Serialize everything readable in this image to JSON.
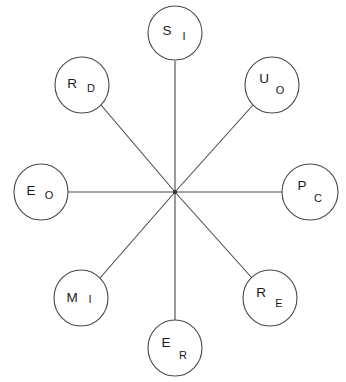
{
  "diagram": {
    "type": "radial-star-network",
    "canvas": {
      "width": 346,
      "height": 382,
      "background": "#ffffff"
    },
    "stroke_color": "#4a4a4a",
    "text_color": "#1a1a1a",
    "hub": {
      "label": "center-hub",
      "x": 175,
      "y": 192
    },
    "nodes": [
      {
        "id": "node-top",
        "main": "S",
        "sub": "I",
        "cx": 175,
        "cy": 33,
        "rx": 27,
        "ry": 27,
        "main_dx": -8,
        "main_dy": 2,
        "sub_dx": 9,
        "sub_dy": 7
      },
      {
        "id": "node-top-right",
        "main": "U",
        "sub": "O",
        "cx": 272,
        "cy": 85,
        "rx": 27,
        "ry": 28,
        "main_dx": -8,
        "main_dy": -2,
        "sub_dx": 8,
        "sub_dy": 9
      },
      {
        "id": "node-right",
        "main": "P",
        "sub": "C",
        "cx": 310,
        "cy": 192,
        "rx": 28,
        "ry": 28,
        "main_dx": -8,
        "main_dy": -2,
        "sub_dx": 8,
        "sub_dy": 10
      },
      {
        "id": "node-bottom-right",
        "main": "R",
        "sub": "E",
        "cx": 270,
        "cy": 298,
        "rx": 27,
        "ry": 28,
        "main_dx": -9,
        "main_dy": -1,
        "sub_dx": 9,
        "sub_dy": 9
      },
      {
        "id": "node-bottom",
        "main": "E",
        "sub": "R",
        "cx": 175,
        "cy": 348,
        "rx": 27,
        "ry": 28,
        "main_dx": -9,
        "main_dy": -1,
        "sub_dx": 8,
        "sub_dy": 11
      },
      {
        "id": "node-bottom-left",
        "main": "M",
        "sub": "I",
        "cx": 81,
        "cy": 298,
        "rx": 27,
        "ry": 28,
        "main_dx": -9,
        "main_dy": 4,
        "sub_dx": 9,
        "sub_dy": 5
      },
      {
        "id": "node-left",
        "main": "E",
        "sub": "O",
        "cx": 41,
        "cy": 192,
        "rx": 27,
        "ry": 28,
        "main_dx": -10,
        "main_dy": 3,
        "sub_dx": 8,
        "sub_dy": 7
      },
      {
        "id": "node-top-left",
        "main": "R",
        "sub": "D",
        "cx": 82,
        "cy": 85,
        "rx": 27,
        "ry": 28,
        "main_dx": -10,
        "main_dy": 3,
        "sub_dx": 9,
        "sub_dy": 7
      }
    ],
    "edges": [
      {
        "id": "edge-hub-top",
        "from": "center-hub",
        "to": "node-top",
        "x1": 175,
        "y1": 192,
        "x2": 175,
        "y2": 61
      },
      {
        "id": "edge-hub-top-right",
        "from": "center-hub",
        "to": "node-top-right",
        "x1": 175,
        "y1": 192,
        "x2": 253,
        "y2": 105
      },
      {
        "id": "edge-hub-right",
        "from": "center-hub",
        "to": "node-right",
        "x1": 175,
        "y1": 192,
        "x2": 282,
        "y2": 192
      },
      {
        "id": "edge-hub-bottom-right",
        "from": "center-hub",
        "to": "node-bottom-right",
        "x1": 175,
        "y1": 192,
        "x2": 252,
        "y2": 278
      },
      {
        "id": "edge-hub-bottom",
        "from": "center-hub",
        "to": "node-bottom",
        "x1": 175,
        "y1": 192,
        "x2": 175,
        "y2": 320
      },
      {
        "id": "edge-hub-bottom-left",
        "from": "center-hub",
        "to": "node-bottom-left",
        "x1": 175,
        "y1": 192,
        "x2": 100,
        "y2": 278
      },
      {
        "id": "edge-hub-left",
        "from": "center-hub",
        "to": "node-left",
        "x1": 175,
        "y1": 192,
        "x2": 68,
        "y2": 192
      },
      {
        "id": "edge-hub-top-left",
        "from": "center-hub",
        "to": "node-top-left",
        "x1": 175,
        "y1": 192,
        "x2": 101,
        "y2": 105
      }
    ]
  }
}
